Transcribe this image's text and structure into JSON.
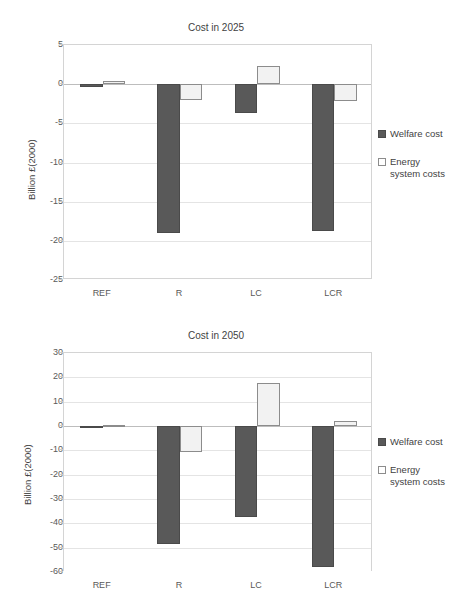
{
  "chart_data": [
    {
      "id": "cost-2025",
      "type": "bar",
      "title": "Cost in 2025",
      "xlabel": "",
      "ylabel": "Billion £(2000)",
      "categories": [
        "REF",
        "R",
        "LC",
        "LCR"
      ],
      "ylim": [
        -25,
        5
      ],
      "ytick_step": 5,
      "yticks": [
        "5",
        "0",
        "-5",
        "-10",
        "-15",
        "-20",
        "-25"
      ],
      "ytick_values": [
        5,
        0,
        -5,
        -10,
        -15,
        -20,
        -25
      ],
      "grid": true,
      "legend_position": "right",
      "series": [
        {
          "name": "Welfare cost",
          "color": "#595959",
          "values": [
            -0.3,
            -19.0,
            -3.7,
            -18.8
          ]
        },
        {
          "name": "Energy\nsystem costs",
          "color": "#f2f2f2",
          "values": [
            0.4,
            -2.0,
            2.3,
            -2.2
          ]
        }
      ]
    },
    {
      "id": "cost-2050",
      "type": "bar",
      "title": "Cost in 2050",
      "xlabel": "",
      "ylabel": "Billion £(2000)",
      "categories": [
        "REF",
        "R",
        "LC",
        "LCR"
      ],
      "ylim": [
        -60,
        30
      ],
      "ytick_step": 10,
      "yticks": [
        "30",
        "20",
        "10",
        "0",
        "-10",
        "-20",
        "-30",
        "-40",
        "-50",
        "-60"
      ],
      "ytick_values": [
        30,
        20,
        10,
        0,
        -10,
        -20,
        -30,
        -40,
        -50,
        -60
      ],
      "grid": true,
      "legend_position": "right",
      "series": [
        {
          "name": "Welfare cost",
          "color": "#595959",
          "values": [
            -0.7,
            -48.5,
            -37.5,
            -58.0
          ]
        },
        {
          "name": "Energy\nsystem costs",
          "color": "#f2f2f2",
          "values": [
            0.3,
            -10.5,
            17.5,
            2.0
          ]
        }
      ]
    }
  ],
  "top": {
    "title": "Cost in 2025",
    "ylabel": "Billion £(2000)",
    "yticks": [
      "5",
      "0",
      "-5",
      "-10",
      "-15",
      "-20",
      "-25"
    ],
    "xticks": [
      "REF",
      "R",
      "LC",
      "LCR"
    ],
    "legend": {
      "welfare_label": "Welfare cost",
      "energy_label": "Energy\nsystem costs"
    }
  },
  "bottom": {
    "title": "Cost in 2050",
    "ylabel": "Billion £(2000)",
    "yticks": [
      "30",
      "20",
      "10",
      "0",
      "-10",
      "-20",
      "-30",
      "-40",
      "-50",
      "-60"
    ],
    "xticks": [
      "REF",
      "R",
      "LC",
      "LCR"
    ],
    "legend": {
      "welfare_label": "Welfare cost",
      "energy_label": "Energy\nsystem costs"
    }
  },
  "colors": {
    "welfare": "#595959",
    "energy": "#f2f2f2",
    "energy_border": "#8c8c8c",
    "grid": "#e4e4e4",
    "text": "#3f3f3f"
  }
}
